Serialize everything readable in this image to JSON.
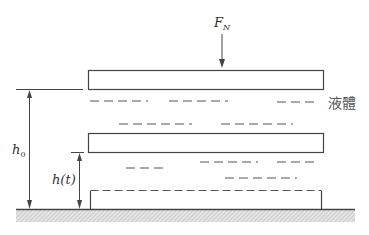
{
  "diagram": {
    "labels": {
      "force": "F",
      "force_subscript": "N",
      "liquid": "液體",
      "initial_height": "h",
      "initial_height_subscript": "0",
      "current_height": "h(t)"
    },
    "colors": {
      "line": "#444444",
      "dash": "#555555",
      "ground_hatch": "#bbbbbb",
      "background": "#ffffff"
    }
  }
}
